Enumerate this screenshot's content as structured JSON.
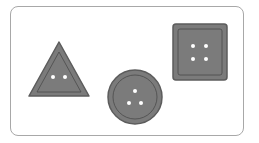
{
  "figure": {
    "colors": {
      "button_fill": "#7b7b7b",
      "button_edge": "#5c5c5c",
      "inner_ring": "#4a4a4a",
      "hole": "#ffffff",
      "frame_border": "#a8a8a8"
    },
    "shapes": [
      {
        "name": "triangle",
        "holes": 2
      },
      {
        "name": "circle",
        "holes": 3
      },
      {
        "name": "square",
        "holes": 4
      }
    ]
  }
}
